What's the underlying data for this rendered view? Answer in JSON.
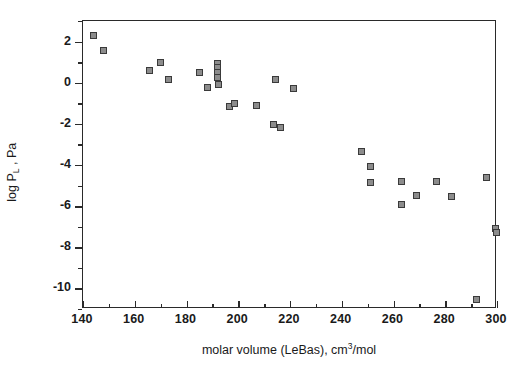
{
  "chart_data": {
    "type": "scatter",
    "title": "",
    "xlabel_parts": {
      "pre": "molar volume (LeBas), cm",
      "sup": "3",
      "post": "/mol"
    },
    "xlabel": "molar volume (LeBas), cm3/mol",
    "ylabel_parts": {
      "pre": "log P",
      "sub": "L",
      "post": " , Pa"
    },
    "ylabel": "log PL , Pa",
    "xlim": [
      140,
      300
    ],
    "ylim": [
      -11,
      3
    ],
    "xticks": [
      140,
      160,
      180,
      200,
      220,
      240,
      260,
      280,
      300
    ],
    "xminorticks": [
      150,
      170,
      190,
      210,
      230,
      250,
      270,
      290
    ],
    "yticks": [
      2,
      0,
      -2,
      -4,
      -6,
      -8,
      -10
    ],
    "yminorticks": [
      3,
      1,
      -1,
      -3,
      -5,
      -7,
      -9,
      -11
    ],
    "xtick_labels": [
      "140",
      "160",
      "180",
      "200",
      "220",
      "240",
      "260",
      "280",
      "300"
    ],
    "ytick_labels": [
      "2",
      "0",
      "-2",
      "-4",
      "-6",
      "-8",
      "-10"
    ],
    "grid": false,
    "legend": "none",
    "marker": {
      "shape": "square",
      "fill": "#8c8c8c",
      "edge": "#3a3a3a",
      "size_px": 7
    },
    "points": [
      {
        "x": 144.0,
        "y": 2.28
      },
      {
        "x": 148.0,
        "y": 1.55
      },
      {
        "x": 165.8,
        "y": 0.58
      },
      {
        "x": 170.0,
        "y": 0.97
      },
      {
        "x": 173.2,
        "y": 0.15
      },
      {
        "x": 185.0,
        "y": 0.52
      },
      {
        "x": 188.0,
        "y": -0.25
      },
      {
        "x": 192.0,
        "y": 0.95
      },
      {
        "x": 192.0,
        "y": 0.72
      },
      {
        "x": 192.0,
        "y": 0.48
      },
      {
        "x": 192.0,
        "y": 0.25
      },
      {
        "x": 192.2,
        "y": -0.1
      },
      {
        "x": 196.8,
        "y": -1.18
      },
      {
        "x": 198.6,
        "y": -1.02
      },
      {
        "x": 207.0,
        "y": -1.12
      },
      {
        "x": 213.8,
        "y": -2.02
      },
      {
        "x": 216.5,
        "y": -2.16
      },
      {
        "x": 214.5,
        "y": 0.15
      },
      {
        "x": 221.5,
        "y": -0.3
      },
      {
        "x": 247.5,
        "y": -3.32
      },
      {
        "x": 251.0,
        "y": -4.06
      },
      {
        "x": 251.0,
        "y": -4.85
      },
      {
        "x": 263.2,
        "y": -4.8
      },
      {
        "x": 263.0,
        "y": -5.92
      },
      {
        "x": 268.8,
        "y": -5.48
      },
      {
        "x": 276.8,
        "y": -4.8
      },
      {
        "x": 282.4,
        "y": -5.55
      },
      {
        "x": 292.0,
        "y": -10.55
      },
      {
        "x": 295.8,
        "y": -4.62
      },
      {
        "x": 299.6,
        "y": -7.1
      },
      {
        "x": 299.8,
        "y": -7.3
      }
    ]
  }
}
